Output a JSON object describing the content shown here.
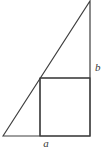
{
  "figure": {
    "background_color": "#ffffff",
    "stroke_color": "#3f3f3f",
    "stroke_width": 1.2,
    "canvas": {
      "width": 106,
      "height": 159
    },
    "triangle": {
      "name": "right-triangle",
      "vertices": [
        {
          "id": "bottom-left",
          "x": 3,
          "y": 136
        },
        {
          "id": "apex-top-right",
          "x": 90,
          "y": 1
        },
        {
          "id": "bottom-right",
          "x": 90,
          "y": 136
        }
      ],
      "points_attr": "3,136 90,1 90,136"
    },
    "square": {
      "name": "inscribed-square",
      "x": 40,
      "y": 78,
      "width": 50,
      "height": 58,
      "vertices": [
        {
          "id": "top-left",
          "x": 40,
          "y": 78
        },
        {
          "id": "top-right",
          "x": 90,
          "y": 78
        },
        {
          "id": "bottom-right",
          "x": 90,
          "y": 136
        },
        {
          "id": "bottom-left",
          "x": 40,
          "y": 136
        }
      ]
    },
    "labels": [
      {
        "id": "label-a",
        "text": "a",
        "x": 46,
        "y": 147,
        "describes": "bottom side of square",
        "style": "italic"
      },
      {
        "id": "label-b",
        "text": "b",
        "x": 95,
        "y": 71,
        "describes": "vertical segment above square on right side",
        "style": "italic"
      }
    ]
  }
}
